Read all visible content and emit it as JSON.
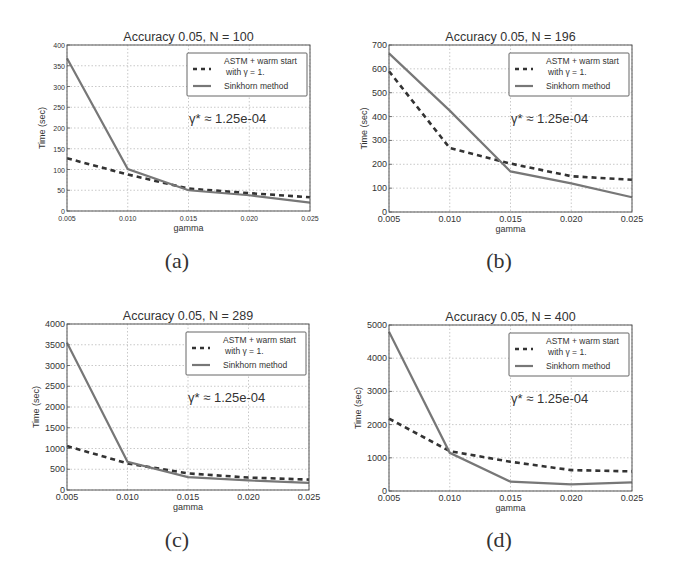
{
  "figure": {
    "captions": [
      "(a)",
      "(b)",
      "(c)",
      "(d)"
    ]
  },
  "chart_data": [
    {
      "type": "line",
      "title": "Accuracy 0.05, N = 100",
      "xlabel": "gamma",
      "ylabel": "Time (sec)",
      "x": [
        0.005,
        0.01,
        0.015,
        0.02,
        0.025
      ],
      "xticks": [
        "0.005",
        "0.010",
        "0.015",
        "0.020",
        "0.025"
      ],
      "xlim": [
        0.005,
        0.025
      ],
      "ylim": [
        0,
        400
      ],
      "yticks": [
        0,
        50,
        100,
        150,
        200,
        250,
        300,
        350,
        400
      ],
      "grid": true,
      "legend_position": "upper right",
      "annotation": "γ* ≈ 1.25e-04",
      "series": [
        {
          "name": "ASTM + warm start with γ = 1.",
          "style": "dashed",
          "values": [
            127,
            88,
            54,
            43,
            33
          ]
        },
        {
          "name": "Sinkhorn method",
          "style": "solid",
          "values": [
            368,
            101,
            50,
            38,
            20
          ]
        }
      ],
      "caption": "(a)"
    },
    {
      "type": "line",
      "title": "Accuracy 0.05, N = 196",
      "xlabel": "gamma",
      "ylabel": "Time (sec)",
      "x": [
        0.005,
        0.01,
        0.015,
        0.02,
        0.025
      ],
      "xticks": [
        "0.005",
        "0.010",
        "0.015",
        "0.020",
        "0.025"
      ],
      "xlim": [
        0.005,
        0.025
      ],
      "ylim": [
        0,
        700
      ],
      "yticks": [
        0,
        100,
        200,
        300,
        400,
        500,
        600,
        700
      ],
      "grid": true,
      "legend_position": "upper right",
      "annotation": "γ* ≈ 1.25e-04",
      "series": [
        {
          "name": "ASTM + warm start with γ = 1.",
          "style": "dashed",
          "values": [
            590,
            268,
            203,
            150,
            135
          ]
        },
        {
          "name": "Sinkhorn method",
          "style": "solid",
          "values": [
            665,
            425,
            170,
            120,
            62
          ]
        }
      ],
      "caption": "(b)"
    },
    {
      "type": "line",
      "title": "Accuracy 0.05, N = 289",
      "xlabel": "gamma",
      "ylabel": "Time (sec)",
      "x": [
        0.005,
        0.01,
        0.015,
        0.02,
        0.025
      ],
      "xticks": [
        "0.005",
        "0.010",
        "0.015",
        "0.020",
        "0.025"
      ],
      "xlim": [
        0.005,
        0.025
      ],
      "ylim": [
        0,
        4000
      ],
      "yticks": [
        0,
        500,
        1000,
        1500,
        2000,
        2500,
        3000,
        3500,
        4000
      ],
      "grid": true,
      "legend_position": "upper right",
      "annotation": "γ* ≈ 1.25e-04",
      "series": [
        {
          "name": "ASTM + warm start with γ = 1.",
          "style": "dashed",
          "values": [
            1060,
            640,
            400,
            300,
            250
          ]
        },
        {
          "name": "Sinkhorn method",
          "style": "solid",
          "values": [
            3550,
            680,
            310,
            230,
            170
          ]
        }
      ],
      "caption": "(c)"
    },
    {
      "type": "line",
      "title": "Accuracy 0.05, N = 400",
      "xlabel": "gamma",
      "ylabel": "Time (sec)",
      "x": [
        0.005,
        0.01,
        0.015,
        0.02,
        0.025
      ],
      "xticks": [
        "0.005",
        "0.010",
        "0.015",
        "0.020",
        "0.025"
      ],
      "xlim": [
        0.005,
        0.025
      ],
      "ylim": [
        0,
        5000
      ],
      "yticks": [
        0,
        1000,
        2000,
        3000,
        4000,
        5000
      ],
      "grid": true,
      "legend_position": "upper right",
      "annotation": "γ* ≈ 1.25e-04",
      "series": [
        {
          "name": "ASTM + warm start with γ = 1.",
          "style": "dashed",
          "values": [
            2180,
            1200,
            880,
            630,
            590
          ]
        },
        {
          "name": "Sinkhorn method",
          "style": "solid",
          "values": [
            4800,
            1150,
            280,
            200,
            260
          ]
        }
      ],
      "caption": "(d)"
    }
  ],
  "legend": {
    "line1": "ASTM + warm start",
    "line2": "with γ = 1.",
    "line3": "Sinkhorn method"
  }
}
